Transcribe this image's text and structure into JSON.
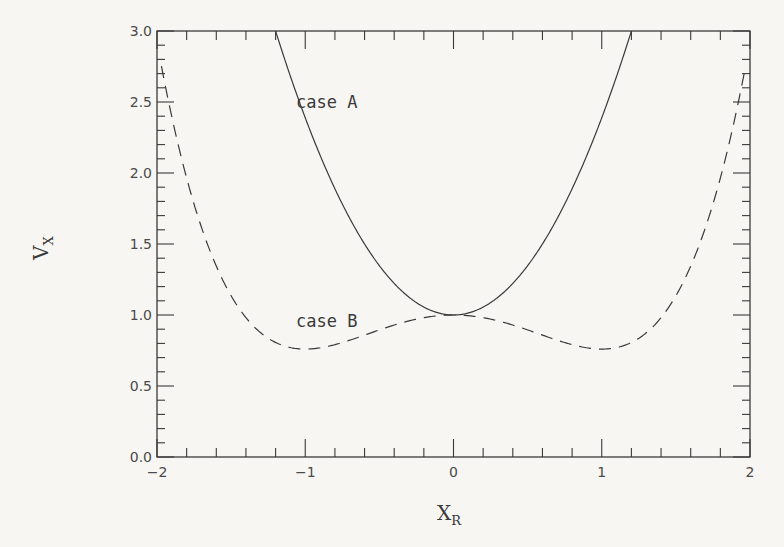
{
  "chart_data": {
    "type": "line",
    "title": "",
    "xlabel": "X",
    "xlabel_sub": "R",
    "ylabel": "V",
    "ylabel_sub": "X",
    "xlim": [
      -2,
      2
    ],
    "ylim": [
      0,
      3
    ],
    "x_major_ticks": [
      -2,
      -1,
      0,
      1,
      2
    ],
    "x_tick_labels": [
      "−2",
      "−1",
      "0",
      "1",
      "2"
    ],
    "x_minor_step": 0.2,
    "y_major_ticks": [
      0,
      0.5,
      1,
      1.5,
      2,
      2.5,
      3
    ],
    "y_tick_labels": [
      "0.0",
      "0.5",
      "1.0",
      "1.5",
      "2.0",
      "2.5",
      "3.0"
    ],
    "y_minor_step": 0.1,
    "grid": false,
    "legend": null,
    "series": [
      {
        "name": "case A",
        "style": "solid",
        "x": [
          -1.2,
          -1.0,
          -0.8,
          -0.6,
          -0.4,
          -0.2,
          0.0,
          0.2,
          0.4,
          0.6,
          0.8,
          1.0,
          1.2
        ],
        "values": [
          3.0,
          2.39,
          1.89,
          1.5,
          1.22,
          1.06,
          1.0,
          1.06,
          1.22,
          1.5,
          1.89,
          2.39,
          3.0
        ]
      },
      {
        "name": "case B",
        "style": "dashed",
        "x": [
          -1.97,
          -1.8,
          -1.6,
          -1.4,
          -1.2,
          -1.0,
          -0.8,
          -0.6,
          -0.4,
          -0.2,
          0.0,
          0.2,
          0.4,
          0.6,
          0.8,
          1.0,
          1.2,
          1.4,
          1.6,
          1.8,
          1.97
        ],
        "values": [
          2.86,
          1.96,
          1.34,
          0.98,
          0.81,
          0.76,
          0.79,
          0.86,
          0.93,
          0.98,
          1.0,
          0.98,
          0.93,
          0.86,
          0.79,
          0.76,
          0.81,
          0.98,
          1.34,
          1.96,
          2.86
        ]
      }
    ],
    "annotations": [
      {
        "text": "case A",
        "x": -1.15,
        "y": 2.5
      },
      {
        "text": "case B",
        "x": -1.15,
        "y": 0.95
      }
    ]
  },
  "colors": {
    "background": "#f7f6f3",
    "ink": "#3a3a3a"
  }
}
